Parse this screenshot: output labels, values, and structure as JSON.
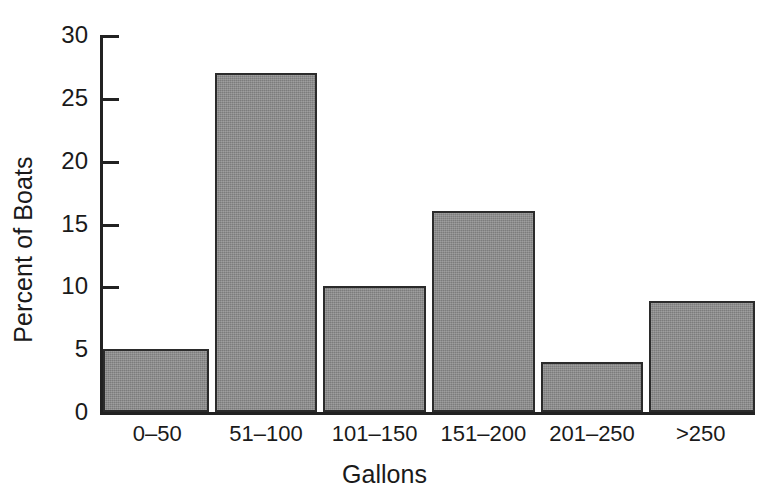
{
  "chart_data": {
    "type": "bar",
    "title": "",
    "xlabel": "Gallons",
    "ylabel": "Percent of Boats",
    "categories": [
      "0–50",
      "51–100",
      "101–150",
      "151–200",
      "201–250",
      ">250"
    ],
    "values": [
      5,
      27,
      10,
      16,
      4,
      8.8
    ],
    "ylim": [
      0,
      30
    ],
    "yticks": [
      0,
      5,
      10,
      15,
      20,
      25,
      30
    ],
    "ytick_labels": [
      "0",
      "5",
      "10",
      "15",
      "20",
      "25",
      "30"
    ],
    "grid": false,
    "legend": false,
    "legend_position": "none",
    "bar_fill_color": "#8a8a8a",
    "bar_edge_color": "#2b2b2b",
    "axis_color": "#222222",
    "text_color": "#1a1a1a",
    "background_color": "#ffffff"
  }
}
